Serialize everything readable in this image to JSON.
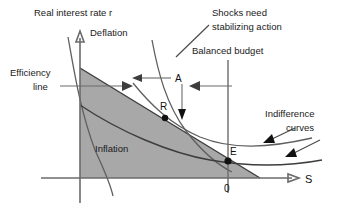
{
  "figure": {
    "type": "economic-policy-diagram",
    "title_visible": false,
    "axes": {
      "y_label": "Real interest rate r",
      "x_label": "S",
      "origin_label": "0"
    },
    "labels": {
      "deflation": "Deflation",
      "inflation": "Inflation",
      "efficiency_line_1": "Efficiency",
      "efficiency_line_2": "line",
      "shocks_line_1": "Shocks need",
      "shocks_line_2": "stabilizing action",
      "balanced_budget": "Balanced budget",
      "indifference_line_1": "Indifference",
      "indifference_line_2": "curves",
      "point_a": "A",
      "point_r": "R",
      "point_e": "E"
    },
    "colors": {
      "region_fill": "#a8a8a8",
      "axis": "#6b6b6b",
      "curve": "#5f5f5f",
      "text": "#1a1a1a"
    },
    "points": [
      {
        "name": "R",
        "x": 165,
        "y": 118
      },
      {
        "name": "E",
        "x": 228,
        "y": 161
      }
    ]
  }
}
